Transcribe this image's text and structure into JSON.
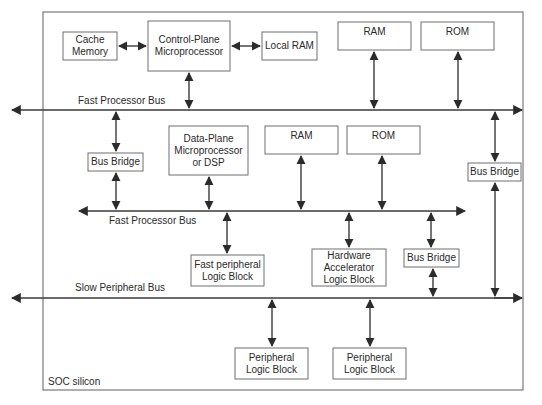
{
  "diagram": {
    "title": "SOC silicon",
    "colors": {
      "line": "#2b2b2b",
      "box_border": "#6e6e6e",
      "background": "#ffffff"
    },
    "buses": [
      {
        "id": "fast_bus_top",
        "label": "Fast Processor Bus"
      },
      {
        "id": "fast_bus_mid",
        "label": "Fast Processor Bus"
      },
      {
        "id": "slow_bus",
        "label": "Slow Peripheral Bus"
      }
    ],
    "blocks": {
      "cache_memory": "Cache Memory",
      "control_plane": "Control-Plane Microprocessor",
      "local_ram": "Local RAM",
      "ram_top": "RAM",
      "rom_top": "ROM",
      "bus_bridge_left": "Bus Bridge",
      "data_plane": "Data-Plane Microprocessor or DSP",
      "ram_mid": "RAM",
      "rom_mid": "ROM",
      "bus_bridge_right": "Bus Bridge",
      "fast_peripheral": "Fast peripheral Logic Block",
      "hw_accelerator": "Hardware Accelerator Logic Block",
      "bus_bridge_lower": "Bus Bridge",
      "peripheral_1": "Peripheral Logic Block",
      "peripheral_2": "Peripheral Logic Block"
    },
    "connections": [
      [
        "Cache Memory",
        "Control-Plane Microprocessor"
      ],
      [
        "Control-Plane Microprocessor",
        "Local RAM"
      ],
      [
        "Control-Plane Microprocessor",
        "Fast Processor Bus (top)"
      ],
      [
        "RAM (top)",
        "Fast Processor Bus (top)"
      ],
      [
        "ROM (top)",
        "Fast Processor Bus (top)"
      ],
      [
        "Fast Processor Bus (top)",
        "Bus Bridge (left)"
      ],
      [
        "Bus Bridge (left)",
        "Fast Processor Bus (middle)"
      ],
      [
        "Fast Processor Bus (top)",
        "Bus Bridge (right)"
      ],
      [
        "Bus Bridge (right)",
        "Slow Peripheral Bus"
      ],
      [
        "Data-Plane Microprocessor or DSP",
        "Fast Processor Bus (middle)"
      ],
      [
        "RAM (middle)",
        "Fast Processor Bus (middle)"
      ],
      [
        "ROM (middle)",
        "Fast Processor Bus (middle)"
      ],
      [
        "Fast Processor Bus (middle)",
        "Fast peripheral Logic Block"
      ],
      [
        "Fast Processor Bus (middle)",
        "Hardware Accelerator Logic Block"
      ],
      [
        "Fast Processor Bus (middle)",
        "Bus Bridge (lower)"
      ],
      [
        "Bus Bridge (lower)",
        "Slow Peripheral Bus"
      ],
      [
        "Slow Peripheral Bus",
        "Peripheral Logic Block (1)"
      ],
      [
        "Slow Peripheral Bus",
        "Peripheral Logic Block (2)"
      ]
    ]
  }
}
